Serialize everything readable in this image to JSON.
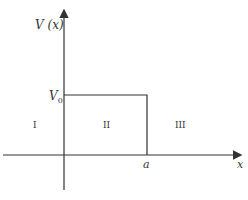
{
  "diagram": {
    "type": "potential-barrier",
    "y_axis_label": "V (x)",
    "x_axis_label": "x",
    "barrier_height_label": "V",
    "barrier_height_subscript": "0",
    "barrier_width_label": "a",
    "regions": [
      {
        "label": "I"
      },
      {
        "label": "II"
      },
      {
        "label": "III"
      }
    ],
    "line_color": "#333333"
  }
}
